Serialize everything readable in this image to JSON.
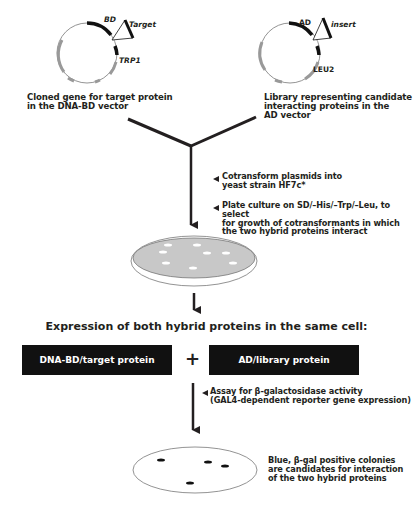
{
  "plasmids": {
    "bd_vector": {
      "fusion_label": "BD",
      "insert_label": "Target",
      "marker_label": "TRP1",
      "caption_line1": "Cloned gene for target protein",
      "caption_line2": "in the DNA-BD vector"
    },
    "ad_vector": {
      "fusion_label": "AD",
      "insert_label": "insert",
      "marker_label": "LEU2",
      "caption_line1": "Library representing candidate",
      "caption_line2": "interacting proteins in the",
      "caption_line3": "AD vector"
    }
  },
  "steps": {
    "cotransform_line1": "Cotransform plasmids into",
    "cotransform_line2": "yeast strain HF7c*",
    "plate_line1": "Plate culture on SD/–His/–Trp/–Leu, to select",
    "plate_line2": "for growth of cotransformants in which",
    "plate_line3": "the two hybrid proteins interact",
    "assay_line1": "Assay for β-galactosidase activity",
    "assay_line2": "(GAL4-dependent reporter gene expression)"
  },
  "expression": {
    "heading": "Expression of both hybrid proteins in the same cell:",
    "box_left": "DNA-BD/target protein",
    "plus": "+",
    "box_right": "AD/library protein"
  },
  "result": {
    "line1": "Blue, β-gal positive colonies",
    "line2": "are candidates for interaction",
    "line3": "of the two hybrid proteins"
  },
  "colors": {
    "ink": "#231f20",
    "plate_fill": "#c8c8c8",
    "box_fill": "#111111"
  }
}
